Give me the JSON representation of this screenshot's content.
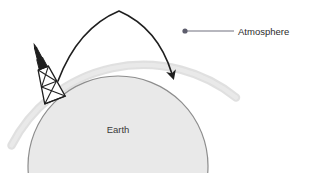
{
  "diagram": {
    "title_visible": false,
    "background_color": "#ffffff",
    "labels": [
      {
        "id": "atmosphere",
        "text": "Atmosphere",
        "x": 238,
        "y": 33,
        "anchor": "start",
        "color": "#2b2b2b"
      },
      {
        "id": "earth",
        "text": "Earth",
        "x": 118,
        "y": 130,
        "anchor": "middle",
        "color": "#3a3a3a"
      }
    ],
    "earth": {
      "name": "Earth",
      "fill_color": "#e8e8e8",
      "stroke_color": "#8a8a8a",
      "center_x": 118,
      "center_y": 166,
      "radius": 90
    },
    "atmosphere": {
      "name": "Atmosphere",
      "band_color": "#dcdcdc",
      "band_width": 7,
      "center_x": 118,
      "center_y": 166,
      "radius": 148,
      "start_angle_deg": 188,
      "end_angle_deg": 332
    },
    "trajectory": {
      "name": "projectile-trajectory",
      "stroke_color": "#1f1f1f",
      "stroke_width": 1.6,
      "start": {
        "x": 58,
        "y": 81
      },
      "apex": {
        "x": 119,
        "y": 10
      },
      "end": {
        "x": 176,
        "y": 79
      },
      "arrowhead": "filled-triangle-down-right"
    },
    "launch_tower": {
      "name": "launch-tower",
      "stroke_color": "#1f1f1f",
      "nose_color": "#1f1f1f",
      "tilt_deg": -22,
      "base_x": 55,
      "base_y": 100,
      "top_x": 32,
      "top_y": 61,
      "lattice_bays": 2
    },
    "leader_line": {
      "name": "atmosphere-leader-line",
      "stroke_color": "#6b6b8a",
      "stroke_width": 1.1,
      "dot_color": "#5a5a6e",
      "dot_radius": 2.4,
      "dot": {
        "x": 185,
        "y": 31
      },
      "line_end": {
        "x": 234,
        "y": 31
      }
    }
  }
}
